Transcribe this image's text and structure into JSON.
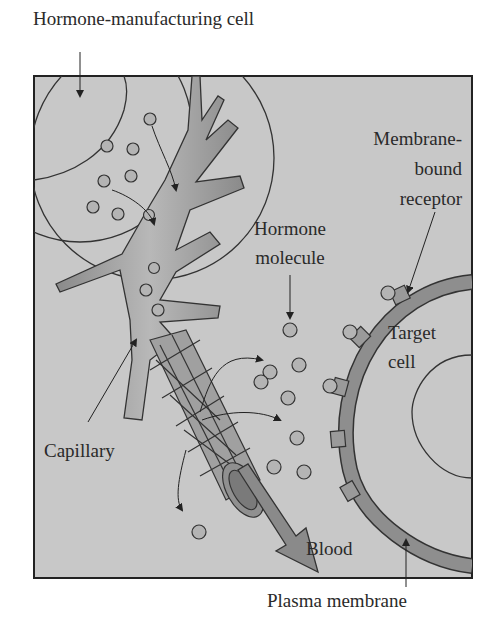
{
  "diagram": {
    "type": "biology-illustration",
    "colors": {
      "panel_background": "#c8c8c8",
      "panel_border": "#222222",
      "capillary_fill": "#9a9a9a",
      "membrane_fill": "#8e8e8e",
      "molecule_fill": "#b4b4b4",
      "outline": "#333333"
    },
    "labels": {
      "hormone_cell": "Hormone-manufacturing cell",
      "receptor_line1": "Membrane-",
      "receptor_line2": "bound",
      "receptor_line3": "receptor",
      "molecule_line1": "Hormone",
      "molecule_line2": "molecule",
      "target_line1": "Target",
      "target_line2": "cell",
      "capillary": "Capillary",
      "blood": "Blood",
      "plasma_membrane": "Plasma membrane"
    },
    "components": [
      "hormone-manufacturing cell",
      "hormone molecules",
      "capillary",
      "blood flow arrow",
      "target cell",
      "plasma membrane",
      "membrane-bound receptors"
    ]
  }
}
